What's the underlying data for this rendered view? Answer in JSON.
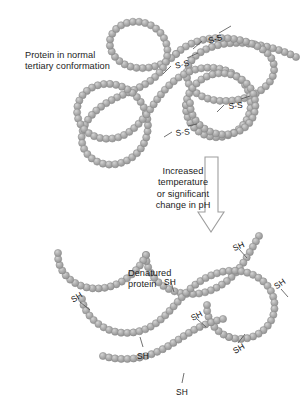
{
  "figure": {
    "title_normal": "Protein in normal\ntertiary conformation",
    "title_denatured": "Denatured\nprotein",
    "transition_text": "Increased\ntemperature\nor significant\nchange in pH",
    "colors": {
      "bead_fill": "#a9a9a9",
      "bead_highlight": "#cfcfcf",
      "bead_outline": "#8a8a8a",
      "text": "#1c1c1c",
      "arrow_outline": "#9a9a9a",
      "arrow_fill": "#ffffff",
      "background": "#ffffff",
      "leader_line": "#5a5a5a"
    }
  },
  "disulfide_bonds": {
    "label": "S-S",
    "count": 4,
    "items": [
      {
        "label": "S-S",
        "x": 207,
        "y": 36,
        "rot": -17
      },
      {
        "label": "S-S",
        "x": 174,
        "y": 61,
        "rot": -13
      },
      {
        "label": "S-S",
        "x": 228,
        "y": 101,
        "rot": -5
      },
      {
        "label": "S-S",
        "x": 175,
        "y": 128,
        "rot": -7
      }
    ]
  },
  "thiol_groups": {
    "label": "SH",
    "count": 8,
    "items": [
      {
        "label": "SH",
        "x": 231,
        "y": 244,
        "rot": -24
      },
      {
        "label": "SH",
        "x": 164,
        "y": 277,
        "rot": 0
      },
      {
        "label": "SH",
        "x": 272,
        "y": 283,
        "rot": -35
      },
      {
        "label": "SH",
        "x": 69,
        "y": 296,
        "rot": -32
      },
      {
        "label": "SH",
        "x": 189,
        "y": 314,
        "rot": -28
      },
      {
        "label": "SH",
        "x": 137,
        "y": 351,
        "rot": 0
      },
      {
        "label": "SH",
        "x": 231,
        "y": 347,
        "rot": -30
      },
      {
        "label": "SH",
        "x": 176,
        "y": 387,
        "rot": 0
      }
    ]
  },
  "arrow": {
    "name": "downward-transition-arrow",
    "x_center": 211,
    "y_top": 157,
    "y_bottom": 232,
    "shaft_width": 13,
    "head_width": 26,
    "head_height": 20
  },
  "chains": {
    "normal": {
      "name": "folded-polypeptide-chain",
      "bead_radius": 3.6,
      "paths": [
        "M 296,57 C 284,51 268,46 252,44 C 232,41 212,44 198,54 C 186,63 184,76 190,86 C 196,96 210,101 224,101 C 242,101 258,95 268,84 C 277,74 276,60 266,52 C 254,42 236,38 220,38 C 202,38 186,44 176,54",
        "M 176,54 C 166,64 152,69 138,68 C 124,67 112,58 110,46 C 108,34 118,24 131,22 C 145,20 158,27 164,38 C 170,49 168,62 160,72 C 150,84 134,90 120,96 C 104,103 90,113 84,127 C 78,141 84,156 98,162 C 112,168 128,163 138,152 C 148,141 150,126 146,113",
        "M 146,113 C 142,100 132,90 120,86 C 106,81 90,85 82,96 C 74,107 76,122 86,131 C 96,140 112,141 124,135 C 138,128 147,114 156,101 C 166,87 178,75 194,70 C 210,65 228,68 240,79 C 252,90 254,108 246,121 C 238,134 222,140 208,136 C 194,132 185,119 186,105",
        "M 186,105 C 187,92 196,81 208,76 C 222,70 238,74 248,85 C 257,95 258,111 250,122 C 242,133 227,137 214,133 C 200,129 190,117 190,103"
      ]
    },
    "denatured": {
      "name": "unfolded-polypeptide-chain",
      "bead_radius": 3.6,
      "paths": [
        "M 259,236 C 252,248 246,260 238,270 C 230,280 219,288 206,292 C 192,296 177,294 165,287 C 153,280 146,268 146,255",
        "M 146,255 C 146,255 146,255 146,255 C 140,268 130,278 117,284 C 104,290 89,290 77,284 C 65,278 57,266 58,253",
        "M 82,299 C 84,312 94,323 107,329 C 121,335 137,334 150,327 C 163,320 172,308 182,297 C 192,286 204,277 218,273 C 234,268 252,271 264,282 C 276,293 278,311 269,324 C 260,337 243,342 229,337",
        "M 229,337 C 215,332 206,319 207,305",
        "M 103,356 C 117,360 132,360 146,356 C 160,352 172,344 184,336 C 196,328 209,322 223,319"
      ]
    }
  }
}
